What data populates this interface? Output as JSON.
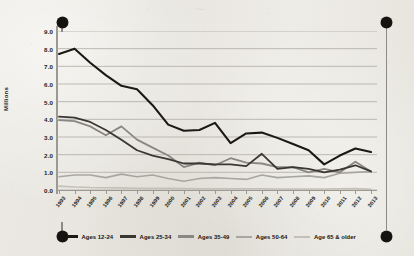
{
  "chart_data": {
    "type": "line",
    "title": "",
    "xlabel": "",
    "ylabel": "Millions",
    "ylim": [
      0.0,
      9.0
    ],
    "ytick_labels": [
      "9.0",
      "8.0",
      "7.0",
      "6.0",
      "5.0",
      "4.0",
      "3.0",
      "2.0",
      "1.0",
      "0.0"
    ],
    "ytick_values": [
      9.0,
      8.0,
      7.0,
      6.0,
      5.0,
      4.0,
      3.0,
      2.0,
      1.0,
      0.0
    ],
    "grid": true,
    "legend_position": "bottom",
    "categories": [
      "1995",
      "1996",
      "1995b",
      "1996b",
      "1997",
      "1998",
      "1999",
      "2000",
      "2001",
      "2002",
      "2003",
      "2004",
      "2005",
      "2006",
      "2007",
      "2008",
      "2009",
      "2010",
      "2011",
      "2012",
      "2013"
    ],
    "x": [
      "1993",
      "1994",
      "1995",
      "1996",
      "1997",
      "1998",
      "1999",
      "2000",
      "2001",
      "2002",
      "2003",
      "2004",
      "2005",
      "2006",
      "2007",
      "2008",
      "2009",
      "2010",
      "2011",
      "2012",
      "2013"
    ],
    "series": [
      {
        "name": "Ages 12-24",
        "color": "#1b1916",
        "width": 2.1,
        "values": [
          7.7,
          8.0,
          7.2,
          6.5,
          5.9,
          5.7,
          4.8,
          3.7,
          3.35,
          3.4,
          3.8,
          2.65,
          3.2,
          3.25,
          2.95,
          2.6,
          2.25,
          1.45,
          1.95,
          2.35,
          2.15
        ]
      },
      {
        "name": "Ages 25-34",
        "color": "#3a3733",
        "width": 1.8,
        "values": [
          4.15,
          4.1,
          3.85,
          3.4,
          2.85,
          2.25,
          1.95,
          1.75,
          1.5,
          1.5,
          1.45,
          1.45,
          1.35,
          2.05,
          1.2,
          1.3,
          1.2,
          1.0,
          1.15,
          1.4,
          1.05
        ]
      },
      {
        "name": "Ages 35-49",
        "color": "#8a8782",
        "width": 1.8,
        "values": [
          3.95,
          3.9,
          3.6,
          3.1,
          3.6,
          2.85,
          2.4,
          1.95,
          1.3,
          1.55,
          1.4,
          1.8,
          1.55,
          1.5,
          1.3,
          1.3,
          1.0,
          1.2,
          1.0,
          1.6,
          1.05
        ]
      },
      {
        "name": "Ages 50-64",
        "color": "#a9a6a0",
        "width": 1.6,
        "values": [
          0.75,
          0.85,
          0.85,
          0.7,
          0.9,
          0.75,
          0.85,
          0.65,
          0.5,
          0.65,
          0.7,
          0.65,
          0.6,
          0.85,
          0.7,
          0.75,
          0.8,
          0.7,
          0.95,
          1.0,
          1.05
        ]
      },
      {
        "name": "Age 65 & older",
        "color": "#c3c0b9",
        "width": 1.6,
        "values": [
          0.22,
          0.17,
          0.14,
          0.13,
          0.12,
          0.1,
          0.09,
          0.09,
          0.08,
          0.07,
          0.07,
          0.07,
          0.07,
          0.07,
          0.06,
          0.06,
          0.06,
          0.06,
          0.07,
          0.08,
          0.04
        ]
      }
    ],
    "legend": [
      {
        "label": "Ages 12-24",
        "color": "#1b1916"
      },
      {
        "label": "Ages 25-34",
        "color": "#3a3733"
      },
      {
        "label": "Ages 35-49",
        "color": "#8a8782"
      },
      {
        "label": "Ages 50-64",
        "color": "#a9a6a0"
      },
      {
        "label": "Age 65 & older",
        "color": "#c3c0b9"
      }
    ]
  },
  "decor": {
    "pin_color": "#15130f",
    "pin_names": [
      "top-left-pin",
      "top-right-pin",
      "bottom-left-pin",
      "bottom-right-pin"
    ]
  }
}
